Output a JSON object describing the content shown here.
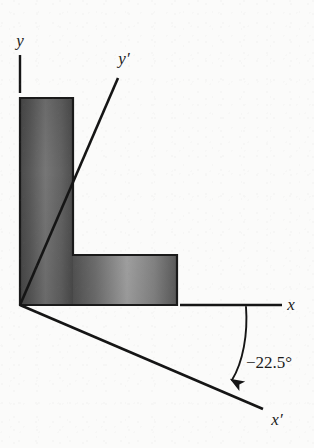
{
  "figure": {
    "background_color": "#fbfbfa",
    "ink_color": "#151515",
    "labels": {
      "y_axis": "y",
      "y_prime_axis": "y′",
      "x_axis": "x",
      "x_prime_axis": "x′",
      "angle": "−22.5°"
    },
    "angle": {
      "value": -22.5,
      "unit": "degrees",
      "display": "−22.5°",
      "description": "clockwise rotation from x to x-prime"
    },
    "shape": {
      "name": "L-section",
      "fill_light": "#b6b6b6",
      "fill_dark": "#4f4f4f",
      "outline_color": "#1a1a1a"
    },
    "geometry": {
      "origin": {
        "x": 20,
        "y": 305
      },
      "y_axis_tick": {
        "x": 20,
        "y_top": 55,
        "y_bottom": 93
      },
      "x_axis_segment": {
        "x_start": 180,
        "x_end": 282,
        "y": 305
      },
      "y_prime_segment": {
        "x1": 20,
        "y1": 305,
        "x2": 118,
        "y2": 78
      },
      "x_prime_segment": {
        "x1": 20,
        "y1": 305,
        "x2": 263,
        "y2": 409
      },
      "l_shape_points": "20,98 73,98 73,255 177,255 177,305 20,305",
      "arc_start": {
        "x": 246,
        "y": 307
      },
      "arc_end": {
        "x": 232,
        "y": 380
      }
    }
  }
}
